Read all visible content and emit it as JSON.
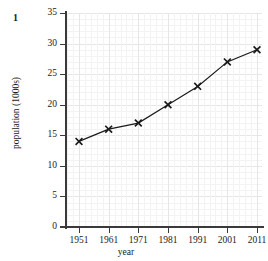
{
  "figure": {
    "question_number": "1",
    "title_partial": "",
    "axis_color": "#3a3a3a",
    "grid_color": "#f3f3f3",
    "grid_major_color": "#e6e6e6",
    "series_color": "#1a1a1a"
  },
  "chart_data": {
    "type": "line",
    "title": "",
    "xlabel": "year",
    "ylabel": "population (1000s)",
    "x": [
      1951,
      1961,
      1971,
      1981,
      1991,
      2001,
      2011
    ],
    "values": [
      14,
      16,
      17,
      20,
      23,
      27,
      29
    ],
    "xticklabels": [
      "1951",
      "1961",
      "1971",
      "1981",
      "1991",
      "2001",
      "2011"
    ],
    "yticklabels": [
      "0",
      "5",
      "10",
      "15",
      "20",
      "25",
      "30",
      "35"
    ],
    "yticks": [
      0,
      5,
      10,
      15,
      20,
      25,
      30,
      35
    ],
    "xlim": [
      1946,
      2016
    ],
    "ylim": [
      0,
      35
    ],
    "grid": true,
    "minor_grid": true,
    "marker": "x",
    "legend": null,
    "legend_position": "none"
  }
}
